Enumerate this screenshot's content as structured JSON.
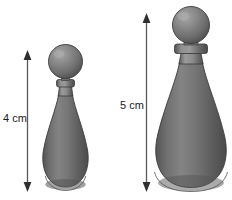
{
  "figure": {
    "background_color": "#ffffff",
    "glass_color": "#6e6e6e",
    "glass_dark": "#4f4f4f",
    "glass_light": "#a9a9a9",
    "outline_color": "#3d3d3d",
    "arrow_color": "#4a4a4a",
    "text_color": "#1a1a1a"
  },
  "objects": [
    {
      "id": "small-bottle",
      "name": "small bottle",
      "height_label": "4 cm",
      "height_value": 4,
      "units": "cm",
      "parts": [
        "ball-stopper",
        "collar",
        "neck",
        "teardrop-body",
        "base"
      ]
    },
    {
      "id": "large-bottle",
      "name": "large bottle",
      "height_label": "5 cm",
      "height_value": 5,
      "units": "cm",
      "parts": [
        "ball-stopper",
        "collar",
        "neck",
        "teardrop-body",
        "base"
      ]
    }
  ],
  "dimensions": {
    "small": {
      "label": "4 cm",
      "arrow_name": "double-headed-arrow"
    },
    "large": {
      "label": "5 cm",
      "arrow_name": "double-headed-arrow"
    }
  },
  "icons": {
    "arrow_up": "arrow-up-icon",
    "arrow_down": "arrow-down-icon"
  }
}
